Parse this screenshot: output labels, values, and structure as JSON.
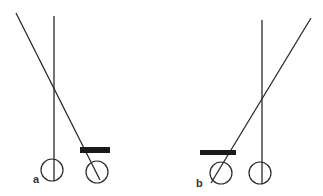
{
  "colors": {
    "line": "#2a2a2a",
    "bar": "#1a1a1a",
    "background": "#ffffff",
    "label": "#333333"
  },
  "panels": [
    {
      "id": "a",
      "label": "a",
      "vertical_line": {
        "x1": 54,
        "y1": 16,
        "x2": 54,
        "y2": 181
      },
      "diagonal_line": {
        "x1": 16,
        "y1": 13,
        "x2": 100,
        "y2": 180
      },
      "circles": [
        {
          "cx": 52,
          "cy": 170,
          "r": 11
        },
        {
          "cx": 97,
          "cy": 172,
          "r": 11
        }
      ],
      "bar": {
        "x": 80,
        "y": 147,
        "width": 30,
        "height": 6
      },
      "label_pos": {
        "x": 33,
        "y": 183
      }
    },
    {
      "id": "b",
      "label": "b",
      "vertical_line": {
        "x1": 262,
        "y1": 20,
        "x2": 262,
        "y2": 184
      },
      "diagonal_line": {
        "x1": 311,
        "y1": 18,
        "x2": 211,
        "y2": 183
      },
      "circles": [
        {
          "cx": 221,
          "cy": 173,
          "r": 11
        },
        {
          "cx": 260,
          "cy": 173,
          "r": 11
        }
      ],
      "bar": {
        "x": 200,
        "y": 150,
        "width": 36,
        "height": 5
      },
      "label_pos": {
        "x": 196,
        "y": 187
      }
    }
  ]
}
